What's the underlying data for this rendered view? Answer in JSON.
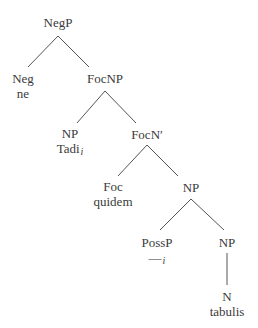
{
  "tree": {
    "root": {
      "label": "NegP"
    },
    "neg": {
      "label": "Neg",
      "word": "ne"
    },
    "focnp": {
      "label": "FocNP"
    },
    "np_subj": {
      "label": "NP",
      "word": "Tadi",
      "index": "i"
    },
    "focnbar": {
      "label": "FocN′"
    },
    "foc": {
      "label": "Foc",
      "word": "quidem"
    },
    "np_obj": {
      "label": "NP"
    },
    "possp": {
      "label": "PossP",
      "word": "—",
      "index": "i"
    },
    "np_inner": {
      "label": "NP"
    },
    "n": {
      "label": "N",
      "word": "tabulis"
    }
  }
}
